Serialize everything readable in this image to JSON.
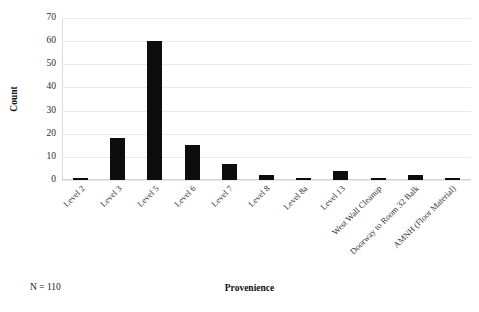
{
  "chart_data": {
    "type": "bar",
    "title": "",
    "xlabel": "Provenience",
    "ylabel": "Count",
    "categories": [
      "Level 2",
      "Level 3",
      "Level 5",
      "Level 6",
      "Level 7",
      "Level 8",
      "Level 8a",
      "Level 13",
      "West Wall Cleanup",
      "Doorway to Room 32 Balk",
      "AMNH (Floor Material)"
    ],
    "values": [
      1,
      18,
      60,
      15,
      7,
      2,
      1,
      4,
      1,
      2,
      1
    ],
    "ylim": [
      0,
      70
    ],
    "yticks": [
      0,
      10,
      20,
      30,
      40,
      50,
      60,
      70
    ],
    "ytick_labels": [
      "0",
      "10",
      "20",
      "30",
      "40",
      "50",
      "60",
      "70"
    ],
    "grid": true,
    "legend": "none",
    "bar_color": "#0d0d0d",
    "gridline_color": "#e9e9e9",
    "background_color": "#ffffff"
  },
  "annotations": {
    "sample_size": "N = 110"
  }
}
